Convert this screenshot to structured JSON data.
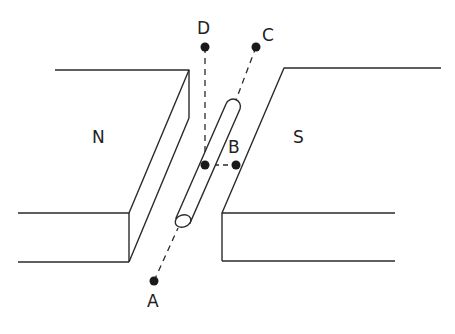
{
  "diagram": {
    "magnets": {
      "north": {
        "label": "N"
      },
      "south": {
        "label": "S"
      }
    },
    "points": [
      {
        "id": "A",
        "label": "A"
      },
      {
        "id": "B",
        "label": "B"
      },
      {
        "id": "C",
        "label": "C"
      },
      {
        "id": "D",
        "label": "D"
      }
    ],
    "line_color": "#222222"
  }
}
